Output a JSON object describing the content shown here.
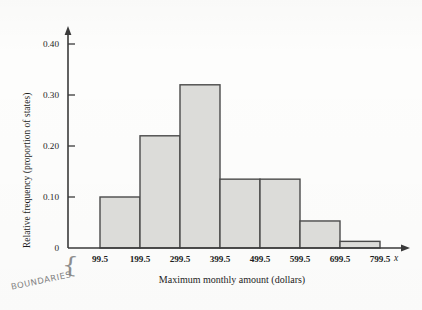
{
  "figure": {
    "xtitle": "Maximum monthly amount (dollars)",
    "ytitle": "Relative frequency (proportion of states)",
    "x_variable_symbol": "x",
    "annotation": {
      "text": "BOUNDARIES",
      "brace_glyph": "{"
    }
  },
  "chart_data": {
    "type": "bar",
    "title": "",
    "subtitle": "",
    "xlabel": "Maximum monthly amount (dollars)",
    "ylabel": "Relative frequency (proportion of states)",
    "bin_boundaries": [
      99.5,
      199.5,
      299.5,
      399.5,
      499.5,
      599.5,
      699.5,
      799.5
    ],
    "categories": [
      "99.5-199.5",
      "199.5-299.5",
      "299.5-399.5",
      "399.5-499.5",
      "499.5-599.5",
      "599.5-699.5",
      "699.5-799.5"
    ],
    "values": [
      0.1,
      0.22,
      0.32,
      0.135,
      0.135,
      0.053,
      0.013
    ],
    "xtick_labels": [
      "99.5",
      "199.5",
      "299.5",
      "399.5",
      "499.5",
      "599.5",
      "699.5",
      "799.5"
    ],
    "ytick_labels": [
      "0",
      "0.10",
      "0.20",
      "0.30",
      "0.40"
    ],
    "ytick_values": [
      0,
      0.1,
      0.2,
      0.3,
      0.4
    ],
    "ylim": [
      0,
      0.44
    ],
    "grid": false,
    "legend": false,
    "bar_fill_color": "#dcdcd9",
    "bar_edge_color": "#4a4a4a",
    "axis_color": "#3a3a3a"
  }
}
